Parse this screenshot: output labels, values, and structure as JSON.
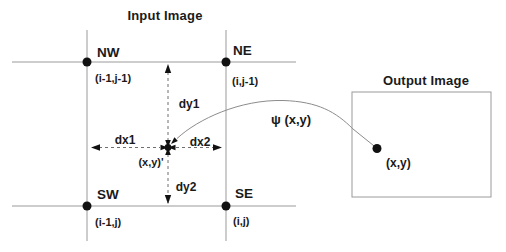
{
  "input_image": {
    "title": "Input Image",
    "corners": [
      {
        "label": "NW",
        "coord": "(i-1,j-1)"
      },
      {
        "label": "NE",
        "coord": "(i,j-1)"
      },
      {
        "label": "SW",
        "coord": "(i-1,j)"
      },
      {
        "label": "SE",
        "coord": "(i,j)"
      }
    ],
    "center_point_label": "(x,y)'",
    "distance_labels": {
      "dx1": "dx1",
      "dx2": "dx2",
      "dy1": "dy1",
      "dy2": "dy2"
    }
  },
  "mapping_label": "ψ (x,y)",
  "output_image": {
    "title": "Output Image",
    "point_label": "(x,y)"
  },
  "colors": {
    "grid_line": "#9a9a9a",
    "dashed_line": "#6f6f6f",
    "mapping_curve": "#8c8c8c",
    "ink": "#111111",
    "background": "#ffffff"
  }
}
